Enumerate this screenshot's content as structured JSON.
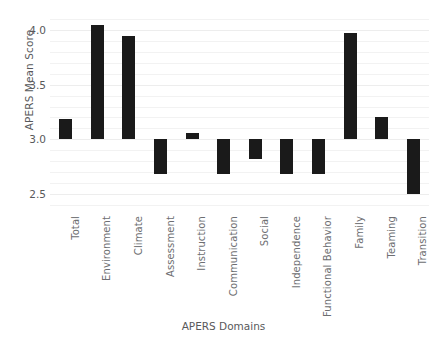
{
  "chart_data": {
    "type": "bar",
    "title": "",
    "xlabel": "APERS Domains",
    "ylabel": "APERS Mean Score",
    "ylim": [
      2.35,
      4.15
    ],
    "yticks": [
      2.5,
      3.0,
      3.5,
      4.0
    ],
    "ytick_labels": [
      "2.5",
      "3.0",
      "3.5",
      "4.0"
    ],
    "baseline": 3.0,
    "grid": true,
    "legend": "none",
    "bar_color": "#1a1a1a",
    "categories": [
      "Total",
      "Environment",
      "Climate",
      "Assessment",
      "Instruction",
      "Communication",
      "Social",
      "Independence",
      "Functional Behavior",
      "Family",
      "Teaming",
      "Transition"
    ],
    "values": [
      3.19,
      4.05,
      3.95,
      2.68,
      3.06,
      2.68,
      2.82,
      2.68,
      2.68,
      3.98,
      3.2,
      2.5
    ]
  }
}
